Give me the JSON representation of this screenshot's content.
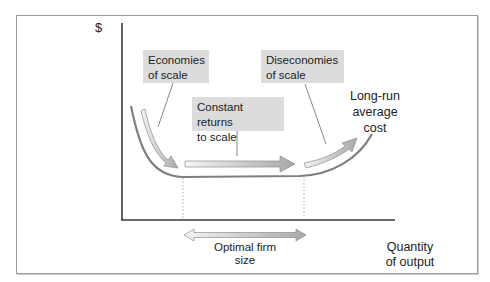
{
  "diagram": {
    "y_axis_label": "$",
    "x_axis_label_line1": "Quantity",
    "x_axis_label_line2": "of output",
    "curve_label_line1": "Long-run",
    "curve_label_line2": "average",
    "curve_label_line3": "cost",
    "callouts": [
      {
        "line1": "Economies",
        "line2": "of scale"
      },
      {
        "line1": "Constant returns",
        "line2": "to scale"
      },
      {
        "line1": "Diseconomies",
        "line2": "of scale"
      }
    ],
    "range_label_line1": "Optimal firm",
    "range_label_line2": "size",
    "colors": {
      "axis": "#3a3a3a",
      "curve": "#7f7f7f",
      "callout_fill": "#dcdcdc",
      "arrow_fill": "#b8b8b8",
      "arrow_outline": "#8e8e8e"
    }
  }
}
